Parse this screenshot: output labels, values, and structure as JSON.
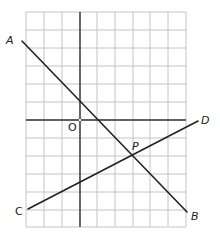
{
  "diagram": {
    "type": "coordinate-grid",
    "grid": {
      "x_lines": [
        26,
        44,
        62,
        80,
        97,
        115,
        133,
        150,
        168,
        186
      ],
      "y_lines": [
        12,
        30,
        48,
        66,
        84,
        102,
        120,
        138,
        156,
        174,
        192,
        210,
        227
      ],
      "color": "#bfbfbf"
    },
    "axes": {
      "x_axis_y": 120,
      "y_axis_x": 80,
      "color": "#333333"
    },
    "origin": {
      "label": "O",
      "x": 80,
      "y": 120
    },
    "lines": [
      {
        "name": "AB",
        "from_label": "A",
        "to_label": "B",
        "x1": 22,
        "y1": 41,
        "x2": 187,
        "y2": 212
      },
      {
        "name": "CD",
        "from_label": "C",
        "to_label": "D",
        "x1": 28,
        "y1": 209,
        "x2": 198,
        "y2": 121
      }
    ],
    "intersection": {
      "label": "P",
      "x": 133,
      "y": 156
    },
    "labels": {
      "A": "A",
      "B": "B",
      "C": "C",
      "D": "D",
      "O": "O",
      "P": "P"
    }
  }
}
